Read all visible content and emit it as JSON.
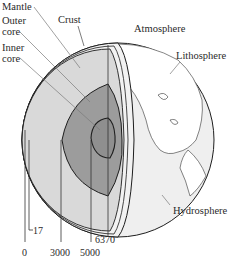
{
  "diagram": {
    "colors": {
      "mantle": "#d9d9d9",
      "outer_core": "#9c9c9c",
      "inner_core": "#8f8f8f",
      "hydrosphere": "#ececec",
      "outline": "#1e1e1e",
      "leader": "#7a7a7a"
    },
    "labels": {
      "mantle": "Mantle",
      "outer_core_1": "Outer",
      "outer_core_2": "core",
      "inner_core_1": "Inner",
      "inner_core_2": "core",
      "crust": "Crust",
      "atmosphere": "Atmosphere",
      "lithosphere": "Lithosphere",
      "hydrosphere": "Hydrosphere"
    },
    "depth_scale": {
      "unit": "km",
      "ticks": [
        "0",
        "17",
        "3000",
        "5000",
        "6370"
      ]
    }
  }
}
